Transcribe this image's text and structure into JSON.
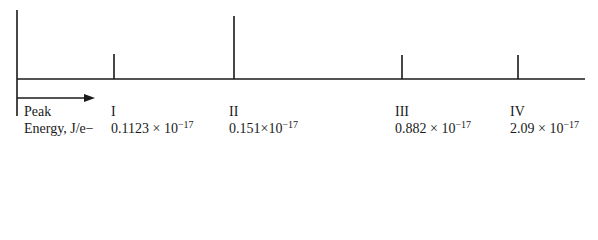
{
  "diagram": {
    "type": "spectrum",
    "axis_label_top": "Peak",
    "axis_label_bottom": "Energy, J/e−",
    "stroke_color": "#1a1a1a",
    "peaks": [
      {
        "label": "I",
        "mantissa": "0.1123",
        "times": "×",
        "base": "10",
        "exponent": "−17",
        "x": 114,
        "top": 54
      },
      {
        "label": "II",
        "mantissa": "0.151",
        "times": "×",
        "base": "10",
        "exponent": "−17",
        "x": 234,
        "top": 16
      },
      {
        "label": "III",
        "mantissa": "0.882",
        "times": "×",
        "base": "10",
        "exponent": "−17",
        "x": 402,
        "top": 55
      },
      {
        "label": "IV",
        "mantissa": "2.09",
        "times": "×",
        "base": "10",
        "exponent": "−17",
        "x": 518,
        "top": 55
      }
    ]
  }
}
